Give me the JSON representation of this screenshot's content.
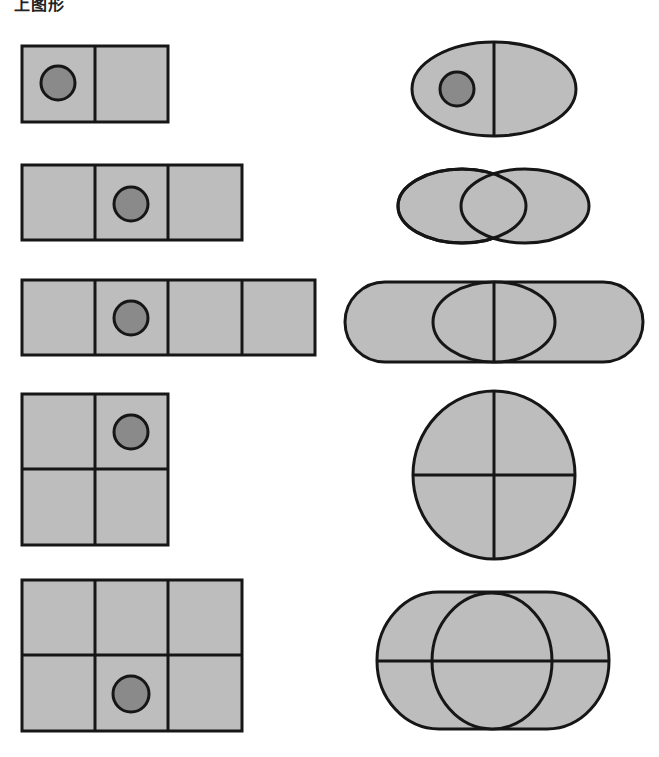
{
  "title": "上图形",
  "colors": {
    "fill": "#bdbdbd",
    "dot": "#8a8a8a",
    "stroke": "#161616",
    "background": "#ffffff"
  },
  "left_shapes": [
    {
      "name": "rect-1x2",
      "cols": 2,
      "rows": 1,
      "dot_cell": [
        0,
        0
      ]
    },
    {
      "name": "rect-1x3",
      "cols": 3,
      "rows": 1,
      "dot_cell": [
        1,
        0
      ]
    },
    {
      "name": "rect-1x4",
      "cols": 4,
      "rows": 1,
      "dot_cell": [
        1,
        0
      ]
    },
    {
      "name": "rect-2x2",
      "cols": 2,
      "rows": 2,
      "dot_cell": [
        1,
        0
      ]
    },
    {
      "name": "rect-2x3",
      "cols": 3,
      "rows": 2,
      "dot_cell": [
        1,
        1
      ]
    }
  ],
  "right_shapes": [
    {
      "name": "ellipse-split-vertical",
      "has_dot": true
    },
    {
      "name": "two-overlapping-ellipses",
      "has_dot": false
    },
    {
      "name": "stadium-with-ellipse-and-vertical-line",
      "has_dot": false
    },
    {
      "name": "circle-quartered",
      "has_dot": false
    },
    {
      "name": "stadium-with-circle-and-horizontal-line",
      "has_dot": false
    }
  ]
}
